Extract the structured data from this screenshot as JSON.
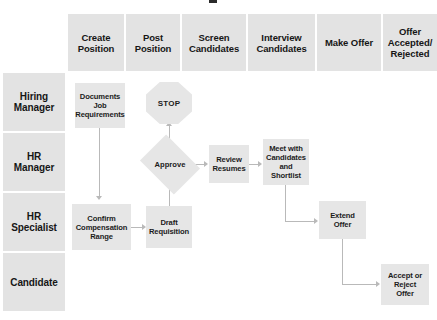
{
  "diagram": {
    "type": "swimlane-flowchart",
    "title_clipped": "",
    "columns": [
      {
        "id": "create-position",
        "label_lines": [
          "Create",
          "Position"
        ]
      },
      {
        "id": "post-position",
        "label_lines": [
          "Post",
          "Position"
        ]
      },
      {
        "id": "screen-candidates",
        "label_lines": [
          "Screen",
          "Candidates"
        ]
      },
      {
        "id": "interview-candidates",
        "label_lines": [
          "Interview",
          "Candidates"
        ]
      },
      {
        "id": "make-offer",
        "label_lines": [
          "Make Offer"
        ]
      },
      {
        "id": "offer-accepted-rejected",
        "label_lines": [
          "Offer",
          "Accepted/",
          "Rejected"
        ]
      }
    ],
    "lanes": [
      {
        "id": "hiring-manager",
        "label_lines": [
          "Hiring",
          "Manager"
        ]
      },
      {
        "id": "hr-manager",
        "label_lines": [
          "HR",
          "Manager"
        ]
      },
      {
        "id": "hr-specialist",
        "label_lines": [
          "HR",
          "Specialist"
        ]
      },
      {
        "id": "candidate",
        "label_lines": [
          "Candidate"
        ]
      }
    ],
    "nodes": [
      {
        "id": "documents-job-requirements",
        "shape": "process",
        "label_lines": [
          "Documents",
          "Job",
          "Requirements"
        ],
        "lane": "hiring-manager",
        "column": "create-position"
      },
      {
        "id": "stop",
        "shape": "octagon",
        "label_lines": [
          "STOP"
        ],
        "lane": "hiring-manager",
        "column": "post-position"
      },
      {
        "id": "approve",
        "shape": "decision",
        "label_lines": [
          "Approve"
        ],
        "lane": "hr-manager",
        "column": "post-position"
      },
      {
        "id": "review-resumes",
        "shape": "process",
        "label_lines": [
          "Review",
          "Resumes"
        ],
        "lane": "hr-manager",
        "column": "screen-candidates"
      },
      {
        "id": "meet-with-candidates-and-shortlist",
        "shape": "process",
        "label_lines": [
          "Meet with",
          "Candidates",
          "and Shortlist"
        ],
        "lane": "hr-manager",
        "column": "interview-candidates"
      },
      {
        "id": "confirm-compensation-range",
        "shape": "process",
        "label_lines": [
          "Confirm",
          "Compensation",
          "Range"
        ],
        "lane": "hr-specialist",
        "column": "create-position"
      },
      {
        "id": "draft-requisition",
        "shape": "process",
        "label_lines": [
          "Draft",
          "Requisition"
        ],
        "lane": "hr-specialist",
        "column": "post-position"
      },
      {
        "id": "extend-offer",
        "shape": "process",
        "label_lines": [
          "Extend Offer"
        ],
        "lane": "hr-specialist",
        "column": "make-offer"
      },
      {
        "id": "accept-or-reject-offer",
        "shape": "process",
        "label_lines": [
          "Accept or",
          "Reject Offer"
        ],
        "lane": "candidate",
        "column": "offer-accepted-rejected"
      }
    ],
    "edges": [
      {
        "from": "documents-job-requirements",
        "to": "confirm-compensation-range",
        "direction": "down"
      },
      {
        "from": "confirm-compensation-range",
        "to": "draft-requisition",
        "direction": "right"
      },
      {
        "from": "draft-requisition",
        "to": "approve",
        "direction": "up"
      },
      {
        "from": "approve",
        "to": "stop",
        "direction": "up"
      },
      {
        "from": "approve",
        "to": "review-resumes",
        "direction": "right"
      },
      {
        "from": "review-resumes",
        "to": "meet-with-candidates-and-shortlist",
        "direction": "right"
      },
      {
        "from": "meet-with-candidates-and-shortlist",
        "to": "extend-offer",
        "direction": "down-right"
      },
      {
        "from": "extend-offer",
        "to": "accept-or-reject-offer",
        "direction": "down-right"
      }
    ],
    "colors": {
      "background": "#ffffff",
      "band_fill": "#e3e3e3",
      "node_fill": "#e6e6e6",
      "connector": "#b9b9b9",
      "text": "#1a1a1a"
    }
  }
}
